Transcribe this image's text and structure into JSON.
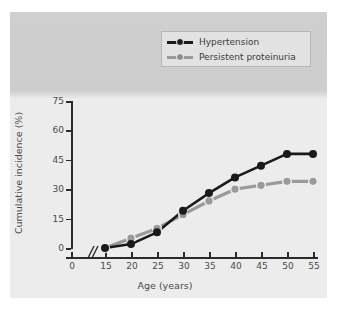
{
  "chart_data": {
    "type": "line",
    "title": "",
    "xlabel": "Age (years)",
    "ylabel": "Cumulative incidence (%)",
    "x": [
      15,
      20,
      25,
      30,
      35,
      40,
      45,
      50,
      55
    ],
    "xtick_labels": [
      "0",
      "15",
      "20",
      "25",
      "30",
      "35",
      "40",
      "45",
      "50",
      "55"
    ],
    "ytick_labels": [
      "0",
      "15",
      "30",
      "45",
      "60",
      "75"
    ],
    "yticks": [
      0,
      15,
      30,
      45,
      60,
      75
    ],
    "xlim": [
      15,
      55
    ],
    "ylim": [
      0,
      75
    ],
    "axis_break": true,
    "axis_break_note": "//",
    "grid": false,
    "legend_position": "top-right",
    "series": [
      {
        "name": "Hypertension",
        "color": "#1a1a1a",
        "values": [
          0,
          2,
          8,
          19,
          28,
          36,
          42,
          48,
          48
        ]
      },
      {
        "name": "Persistent proteinuria",
        "color": "#9a9a9a",
        "values": [
          0,
          5,
          10,
          17,
          24,
          30,
          32,
          34,
          34
        ]
      }
    ]
  },
  "legend": {
    "items": [
      {
        "label": "Hypertension",
        "color": "#1a1a1a"
      },
      {
        "label": "Persistent proteinuria",
        "color": "#9a9a9a"
      }
    ]
  },
  "colors": {
    "series_hypertension": "#1a1a1a",
    "series_proteinuria": "#9a9a9a",
    "axis": "#2b2b2b",
    "text": "#4a4a4a",
    "panel_top": "#cfcfcf",
    "panel_plot": "#edecec",
    "legend_bg": "#e2e2e2",
    "legend_border": "#b6b6b6"
  }
}
